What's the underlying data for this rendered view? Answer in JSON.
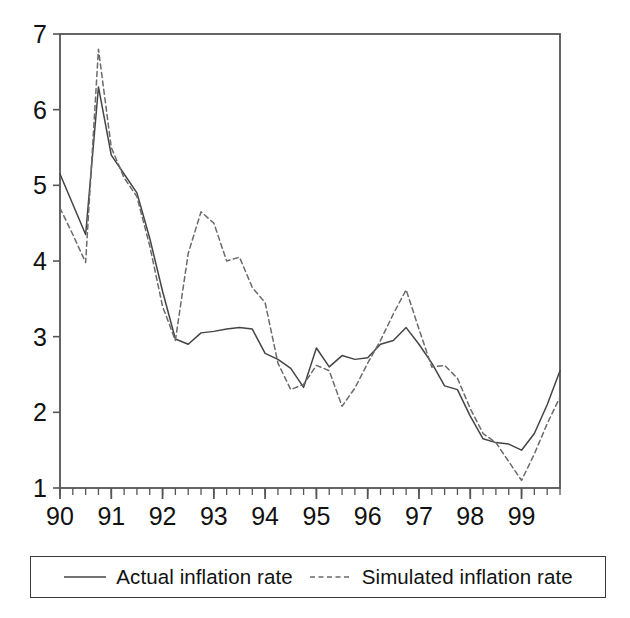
{
  "chart_data": {
    "type": "line",
    "title": "",
    "xlabel": "",
    "ylabel": "",
    "xlim": [
      1990.0,
      1999.75
    ],
    "ylim": [
      1,
      7
    ],
    "grid": false,
    "legend_position": "bottom",
    "x_tick_labels": [
      "90",
      "91",
      "92",
      "93",
      "94",
      "95",
      "96",
      "97",
      "98",
      "99"
    ],
    "x_tick_values": [
      1990,
      1991,
      1992,
      1993,
      1994,
      1995,
      1996,
      1997,
      1998,
      1999
    ],
    "x_minor_tick_interval": 0.25,
    "y_tick_labels": [
      "1",
      "2",
      "3",
      "4",
      "5",
      "6",
      "7"
    ],
    "y_tick_values": [
      1,
      2,
      3,
      4,
      5,
      6,
      7
    ],
    "x": [
      1990.0,
      1990.25,
      1990.5,
      1990.75,
      1991.0,
      1991.25,
      1991.5,
      1991.75,
      1992.0,
      1992.25,
      1992.5,
      1992.75,
      1993.0,
      1993.25,
      1993.5,
      1993.75,
      1994.0,
      1994.25,
      1994.5,
      1994.75,
      1995.0,
      1995.25,
      1995.5,
      1995.75,
      1996.0,
      1996.25,
      1996.5,
      1996.75,
      1997.0,
      1997.25,
      1997.5,
      1997.75,
      1998.0,
      1998.25,
      1998.5,
      1998.75,
      1999.0,
      1999.25,
      1999.5,
      1999.75
    ],
    "series": [
      {
        "name": "Actual inflation rate",
        "style": "solid",
        "color": "#444444",
        "values": [
          5.15,
          4.75,
          4.35,
          6.3,
          5.4,
          5.15,
          4.9,
          4.3,
          3.6,
          2.97,
          2.9,
          3.05,
          3.07,
          3.1,
          3.12,
          3.1,
          2.78,
          2.7,
          2.58,
          2.33,
          2.85,
          2.6,
          2.75,
          2.7,
          2.72,
          2.9,
          2.95,
          3.12,
          2.9,
          2.65,
          2.35,
          2.3,
          1.95,
          1.65,
          1.6,
          1.58,
          1.5,
          1.72,
          2.1,
          2.55
        ]
      },
      {
        "name": "Simulated inflation rate",
        "style": "dashed",
        "color": "#6a6a6a",
        "values": [
          4.7,
          4.35,
          3.98,
          6.8,
          5.5,
          5.1,
          4.85,
          4.2,
          3.4,
          2.95,
          4.1,
          4.65,
          4.5,
          4.0,
          4.05,
          3.65,
          3.45,
          2.65,
          2.3,
          2.37,
          2.62,
          2.55,
          2.08,
          2.32,
          2.65,
          2.95,
          3.3,
          3.62,
          3.1,
          2.6,
          2.62,
          2.45,
          2.05,
          1.72,
          1.6,
          1.35,
          1.1,
          1.45,
          1.85,
          2.2
        ]
      }
    ]
  },
  "legend": {
    "entries": [
      {
        "label": "Actual inflation rate",
        "swatch": "solid-line-swatch"
      },
      {
        "label": "Simulated inflation rate",
        "swatch": "dashed-line-swatch"
      }
    ]
  }
}
